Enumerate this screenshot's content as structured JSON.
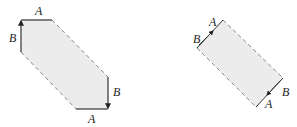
{
  "diagram": {
    "colors": {
      "fill": "#ececec",
      "solid_edge": "#333333",
      "dashed_edge": "#888888",
      "label": "#222222"
    },
    "left_shape": {
      "labels": {
        "top": "A",
        "left": "B",
        "right": "B",
        "bottom": "A"
      }
    },
    "right_shape": {
      "labels": {
        "top_a": "A",
        "top_b": "B",
        "bottom_b": "B",
        "bottom_a": "A"
      }
    }
  }
}
